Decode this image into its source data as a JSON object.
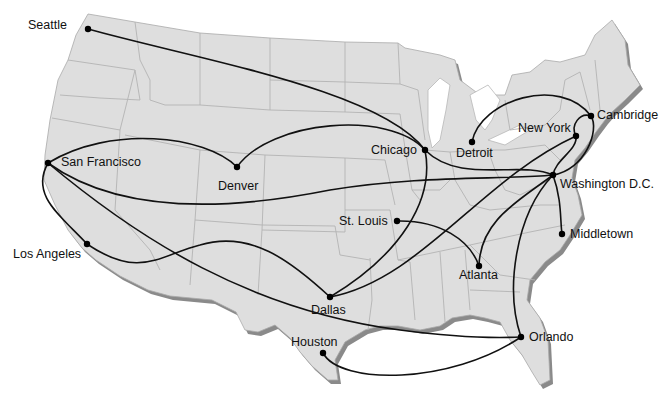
{
  "map": {
    "type": "route-network",
    "region": "Contiguous United States",
    "colors": {
      "land": "#dedede",
      "state_border": "#b3b3b3",
      "shadow": "#8a8a8a",
      "route": "#111111",
      "city_dot": "#000000",
      "background": "#ffffff"
    },
    "cities": [
      {
        "id": "seattle",
        "name": "Seattle",
        "x": 88,
        "y": 29
      },
      {
        "id": "san-francisco",
        "name": "San Francisco",
        "x": 48,
        "y": 163
      },
      {
        "id": "los-angeles",
        "name": "Los Angeles",
        "x": 87,
        "y": 244
      },
      {
        "id": "denver",
        "name": "Denver",
        "x": 237,
        "y": 167
      },
      {
        "id": "chicago",
        "name": "Chicago",
        "x": 425,
        "y": 150
      },
      {
        "id": "detroit",
        "name": "Detroit",
        "x": 472,
        "y": 142
      },
      {
        "id": "st-louis",
        "name": "St. Louis",
        "x": 397,
        "y": 221
      },
      {
        "id": "dallas",
        "name": "Dallas",
        "x": 330,
        "y": 297
      },
      {
        "id": "houston",
        "name": "Houston",
        "x": 323,
        "y": 353
      },
      {
        "id": "atlanta",
        "name": "Atlanta",
        "x": 479,
        "y": 266
      },
      {
        "id": "orlando",
        "name": "Orlando",
        "x": 521,
        "y": 337
      },
      {
        "id": "washington-dc",
        "name": "Washington D.C.",
        "x": 553,
        "y": 175
      },
      {
        "id": "new-york",
        "name": "New York",
        "x": 576,
        "y": 136
      },
      {
        "id": "cambridge",
        "name": "Cambridge",
        "x": 591,
        "y": 116
      },
      {
        "id": "middletown",
        "name": "Middletown",
        "x": 562,
        "y": 234
      }
    ],
    "routes": [
      {
        "from": "Seattle",
        "to": "Chicago"
      },
      {
        "from": "San Francisco",
        "to": "Denver"
      },
      {
        "from": "Denver",
        "to": "Chicago"
      },
      {
        "from": "San Francisco",
        "to": "Washington D.C."
      },
      {
        "from": "San Francisco",
        "to": "Los Angeles"
      },
      {
        "from": "San Francisco",
        "to": "Orlando"
      },
      {
        "from": "Los Angeles",
        "to": "Dallas"
      },
      {
        "from": "Chicago",
        "to": "Dallas"
      },
      {
        "from": "Dallas",
        "to": "New York"
      },
      {
        "from": "Chicago",
        "to": "Washington D.C."
      },
      {
        "from": "St. Louis",
        "to": "Atlanta"
      },
      {
        "from": "Atlanta",
        "to": "Washington D.C."
      },
      {
        "from": "Washington D.C.",
        "to": "Middletown"
      },
      {
        "from": "Washington D.C.",
        "to": "Orlando"
      },
      {
        "from": "Washington D.C.",
        "to": "Cambridge"
      },
      {
        "from": "New York",
        "to": "Washington D.C."
      },
      {
        "from": "Detroit",
        "to": "Cambridge"
      },
      {
        "from": "Houston",
        "to": "Orlando"
      }
    ]
  },
  "labels": {
    "seattle": "Seattle",
    "san_francisco": "San Francisco",
    "los_angeles": "Los Angeles",
    "denver": "Denver",
    "chicago": "Chicago",
    "detroit": "Detroit",
    "st_louis": "St. Louis",
    "dallas": "Dallas",
    "houston": "Houston",
    "atlanta": "Atlanta",
    "orlando": "Orlando",
    "washington_dc": "Washington D.C.",
    "new_york": "New York",
    "cambridge": "Cambridge",
    "middletown": "Middletown"
  }
}
